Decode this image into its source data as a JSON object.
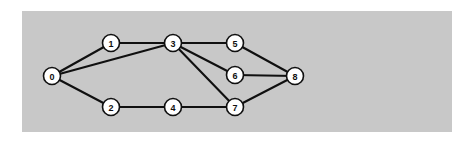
{
  "figure": {
    "background_color": "#ffffff",
    "panel": {
      "name": "graph-panel",
      "fill": "#c8c8c8",
      "x": 22,
      "y": 11,
      "width": 430,
      "height": 121
    }
  },
  "style": {
    "edge_color": "#101010",
    "edge_width": 2.1,
    "node_fill": "#ffffff",
    "node_stroke": "#101010",
    "node_stroke_width": 1.6,
    "node_radius": 8.5,
    "label_color": "#101010"
  },
  "chart_data": {
    "type": "diagram",
    "diagram_kind": "node-link-graph",
    "directed": false,
    "weighted": false,
    "title": "",
    "node_count": 9,
    "edge_count": 11,
    "nodes": [
      {
        "id": "0",
        "label": "0",
        "x": 52,
        "y": 76
      },
      {
        "id": "1",
        "label": "1",
        "x": 111,
        "y": 43
      },
      {
        "id": "2",
        "label": "2",
        "x": 111,
        "y": 107
      },
      {
        "id": "3",
        "label": "3",
        "x": 173,
        "y": 43
      },
      {
        "id": "4",
        "label": "4",
        "x": 173,
        "y": 107
      },
      {
        "id": "5",
        "label": "5",
        "x": 235,
        "y": 43
      },
      {
        "id": "6",
        "label": "6",
        "x": 235,
        "y": 75
      },
      {
        "id": "7",
        "label": "7",
        "x": 235,
        "y": 107
      },
      {
        "id": "8",
        "label": "8",
        "x": 295,
        "y": 76
      }
    ],
    "edges": [
      {
        "source": "0",
        "target": "1"
      },
      {
        "source": "0",
        "target": "2"
      },
      {
        "source": "0",
        "target": "3"
      },
      {
        "source": "1",
        "target": "3"
      },
      {
        "source": "2",
        "target": "4"
      },
      {
        "source": "3",
        "target": "5"
      },
      {
        "source": "3",
        "target": "6"
      },
      {
        "source": "3",
        "target": "7"
      },
      {
        "source": "4",
        "target": "7"
      },
      {
        "source": "5",
        "target": "8"
      },
      {
        "source": "6",
        "target": "8"
      },
      {
        "source": "7",
        "target": "8"
      }
    ],
    "adjacency": {
      "0": [
        "1",
        "2",
        "3"
      ],
      "1": [
        "0",
        "3"
      ],
      "2": [
        "0",
        "4"
      ],
      "3": [
        "0",
        "1",
        "5",
        "6",
        "7"
      ],
      "4": [
        "2",
        "7"
      ],
      "5": [
        "3",
        "8"
      ],
      "6": [
        "3",
        "8"
      ],
      "7": [
        "3",
        "4",
        "8"
      ],
      "8": [
        "5",
        "6",
        "7"
      ]
    }
  }
}
